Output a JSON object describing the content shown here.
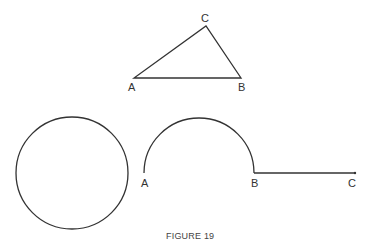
{
  "caption": "FIGURE 19",
  "colors": {
    "stroke": "#333333",
    "background": "#ffffff"
  },
  "triangle": {
    "vertices": {
      "A": {
        "label": "A",
        "x": 134,
        "y": 78
      },
      "B": {
        "label": "B",
        "x": 241,
        "y": 78
      },
      "C": {
        "label": "C",
        "x": 206,
        "y": 26
      }
    }
  },
  "circle": {
    "cx": 72,
    "cy": 173,
    "r": 56
  },
  "semicircle": {
    "A": {
      "label": "A",
      "x": 144,
      "y": 173
    },
    "B": {
      "label": "B",
      "x": 254,
      "y": 173
    },
    "r": 55
  },
  "segment": {
    "B": {
      "label": "B",
      "x": 254,
      "y": 173
    },
    "C": {
      "label": "C",
      "x": 355,
      "y": 173
    }
  }
}
